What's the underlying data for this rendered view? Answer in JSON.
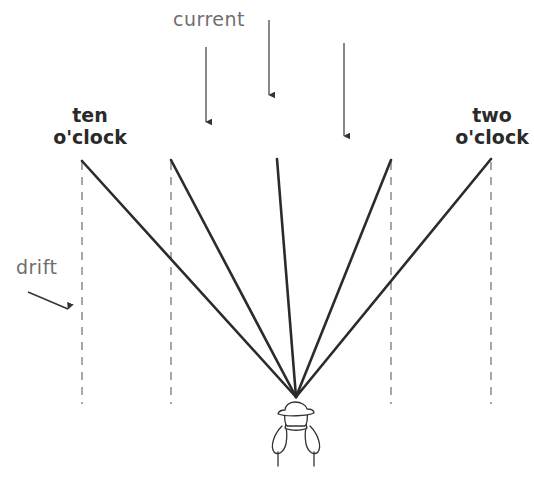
{
  "diagram": {
    "labels": {
      "current": "current",
      "ten_line1": "ten",
      "ten_line2": "o'clock",
      "two_line1": "two",
      "two_line2": "o'clock",
      "drift": "drift"
    },
    "colors": {
      "cast_line": "#2b2b2b",
      "dashed_line": "#8a8a8a",
      "arrow": "#555555",
      "label_gray": "#6e6e6e",
      "label_bold": "#2a2a2a"
    },
    "convergence_point": [
      296,
      397
    ],
    "cast_lines": [
      {
        "name": "ten-oclock",
        "top": [
          82,
          161
        ]
      },
      {
        "name": "eleven-oclock",
        "top": [
          171,
          160
        ]
      },
      {
        "name": "twelve-oclock",
        "top": [
          277,
          159
        ]
      },
      {
        "name": "one-oclock",
        "top": [
          391,
          160
        ]
      },
      {
        "name": "two-oclock",
        "top": [
          491,
          159
        ]
      }
    ],
    "drift_lines_x": [
      82,
      171,
      391,
      491
    ],
    "current_arrows": [
      {
        "x": 206,
        "y1": 47,
        "y2": 122
      },
      {
        "x": 269,
        "y1": 20,
        "y2": 95
      },
      {
        "x": 344,
        "y1": 43,
        "y2": 136
      }
    ],
    "drift_arrow": {
      "from": [
        28,
        292
      ],
      "to": [
        68,
        309
      ]
    }
  }
}
